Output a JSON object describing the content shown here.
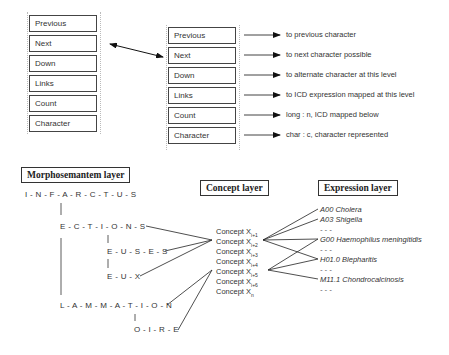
{
  "node_fields_left": [
    "Previous",
    "Next",
    "Down",
    "Links",
    "Count",
    "Character"
  ],
  "node_fields_right": [
    "Previous",
    "Next",
    "Down",
    "Links",
    "Count",
    "Character"
  ],
  "field_descriptions": [
    "to previous character",
    "to next character possible",
    "to alternate character at this level",
    "to ICD expression mapped at this level",
    "long : n, ICD mapped below",
    "char : c, character represented"
  ],
  "layers": {
    "morphosemantem": "Morphosemantem layer",
    "concept": "Concept layer",
    "expression": "Expression layer"
  },
  "sequences": {
    "root": "I - N - F - A - R - C - T - U - S",
    "ections": "E - C - T - I - O - N - S",
    "euses": "E - U - S - E - S",
    "eux": "E - U - X",
    "lammation": "L - A - M - M - A - T - I - O - N",
    "oire": "O - I - R - E"
  },
  "concepts": [
    {
      "label": "Concept X",
      "sub": "i+1"
    },
    {
      "label": "Concept X",
      "sub": "i+2"
    },
    {
      "label": "Concept X",
      "sub": "i+3"
    },
    {
      "label": "Concept X",
      "sub": "i+4"
    },
    {
      "label": "Concept X",
      "sub": "i+5"
    },
    {
      "label": "Concept X",
      "sub": "i+6"
    },
    {
      "label": "Concept X",
      "sub": "n"
    }
  ],
  "expressions": [
    "A00 Cholera",
    "A03 Shigella",
    "- - -",
    "G00 Haemophilus meningitidis",
    "- - -",
    "H01.0 Blepharitis",
    "- - -",
    "M11.1 Chondrocalcinosis",
    "- - -"
  ]
}
